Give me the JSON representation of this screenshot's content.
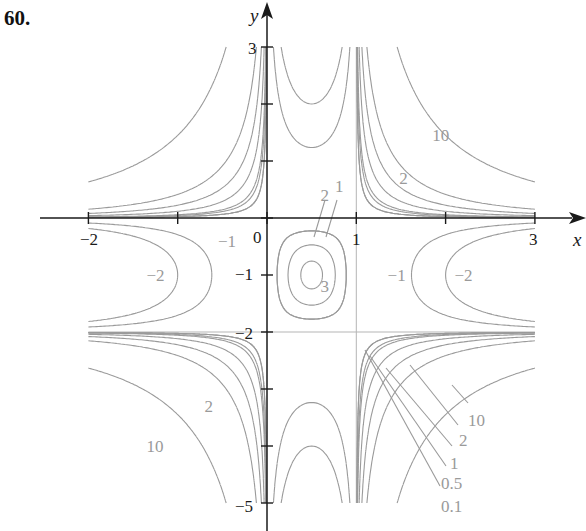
{
  "problem_number": "60.",
  "colors": {
    "axis": "#1a1a1a",
    "contour": "#9a9a9a",
    "guide": "#b5b5b5",
    "background": "#ffffff"
  },
  "chart_data": {
    "type": "contour",
    "title": "",
    "function_observed": "level curves with zero set along x=0, x=1, y=0, y=-2",
    "xlabel": "x",
    "ylabel": "y",
    "xlim": [
      -2,
      3
    ],
    "ylim": [
      -5,
      3
    ],
    "x_ticks": [
      -2,
      -1,
      0,
      1,
      2,
      3
    ],
    "x_tick_labels": [
      "−2",
      "0",
      "1",
      "3"
    ],
    "y_ticks": [
      3,
      2,
      1,
      0,
      -1,
      -2,
      -3,
      -4,
      -5
    ],
    "y_tick_labels": [
      "3",
      "−1",
      "−2",
      "−5"
    ],
    "grid": false,
    "guide_lines": [
      {
        "x": 1
      },
      {
        "y": -2
      }
    ],
    "contour_levels_outer": [
      10,
      2,
      1,
      0.5,
      0.1
    ],
    "contour_levels_negative": [
      -1,
      -2
    ],
    "contour_levels_center": [
      1,
      2,
      3
    ],
    "labels": [
      {
        "text": "10",
        "x": 1.85,
        "y": 1.35
      },
      {
        "text": "2",
        "x": 1.48,
        "y": 0.6
      },
      {
        "text": "2",
        "x": 0.6,
        "y": 0.3
      },
      {
        "text": "1",
        "x": 0.76,
        "y": 0.46
      },
      {
        "text": "3",
        "x": 0.6,
        "y": -1.3
      },
      {
        "text": "−1",
        "x": -0.55,
        "y": -0.5
      },
      {
        "text": "−2",
        "x": -1.35,
        "y": -1.1
      },
      {
        "text": "−1",
        "x": 1.35,
        "y": -1.1
      },
      {
        "text": "−2",
        "x": 2.1,
        "y": -1.1
      },
      {
        "text": "2",
        "x": -0.7,
        "y": -3.4
      },
      {
        "text": "10",
        "x": -1.35,
        "y": -4.1
      },
      {
        "text": "10",
        "x": 2.25,
        "y": -3.65
      },
      {
        "text": "2",
        "x": 2.15,
        "y": -4.0
      },
      {
        "text": "1",
        "x": 2.05,
        "y": -4.4
      },
      {
        "text": "0.5",
        "x": 1.95,
        "y": -4.75
      },
      {
        "text": "0.1",
        "x": 1.95,
        "y": -5.15
      }
    ]
  }
}
